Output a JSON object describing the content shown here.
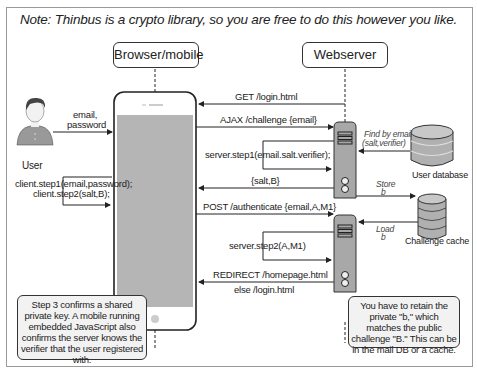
{
  "note": "Note: Thinbus is a crypto library, so you are free to do this however you like.",
  "actors": {
    "browser": "Browser/mobile",
    "webserver": "Webserver"
  },
  "user": {
    "label": "User",
    "input_label_line1": "email,",
    "input_label_line2": "password"
  },
  "client_steps": {
    "line1": "client.step1(email,password);",
    "line2": "client.step2(salt,B);",
    "step3": "client.step3(M2)"
  },
  "messages": {
    "get_login": "GET /login.html",
    "ajax_challenge": "AJAX /challenge {email}",
    "server_step1": "server.step1(email.salt.verifier);",
    "salt_b": "{salt,B}",
    "post_authenticate": "POST /authenticate {email,A,M1}",
    "server_step2": "server.step2(A,M1)",
    "redirect": "REDIRECT /homepage.html",
    "else_login": "else /login.html"
  },
  "datastores": {
    "user_db": "User database",
    "challenge_cache": "Challenge cache",
    "find_line1": "Find by email",
    "find_line2": "(salt,verifier)",
    "store_line1": "Store",
    "store_line2": "b",
    "load_line1": "Load",
    "load_line2": "b"
  },
  "callouts": {
    "left": "Step 3 confirms a shared private key. A mobile running embedded JavaScript also confirms the server knows the verifier that the user registered with.",
    "right": "You have to retain the private \"b,\" which matches the public challenge \"B.\" This can be in the mail DB or a cache."
  },
  "colors": {
    "screen": "#b5b5b5",
    "server": "#a8a8a8",
    "db": "#b0b0b0",
    "stroke": "#222222",
    "callout_bg": "#f2f2f2"
  }
}
